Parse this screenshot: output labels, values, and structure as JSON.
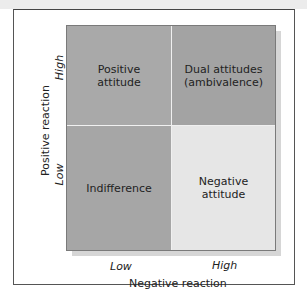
{
  "diagram": {
    "type": "2x2 matrix",
    "x_axis": {
      "label": "Negative reaction",
      "ticks": [
        "Low",
        "High"
      ]
    },
    "y_axis": {
      "label": "Positive reaction",
      "ticks": [
        "High",
        "Low"
      ]
    },
    "cells": {
      "top_left": {
        "label": "Positive attitude",
        "lines": [
          "Positive",
          "attitude"
        ],
        "color": "#a9a9a9"
      },
      "top_right": {
        "label": "Dual attitudes (ambivalence)",
        "lines": [
          "Dual attitudes",
          "(ambivalence)"
        ],
        "color": "#a3a3a3"
      },
      "bottom_left": {
        "label": "Indifference",
        "lines": [
          "Indifference"
        ],
        "color": "#a6a6a6"
      },
      "bottom_right": {
        "label": "Negative attitude",
        "lines": [
          "Negative",
          "attitude"
        ],
        "color": "#e6e6e6"
      }
    }
  }
}
